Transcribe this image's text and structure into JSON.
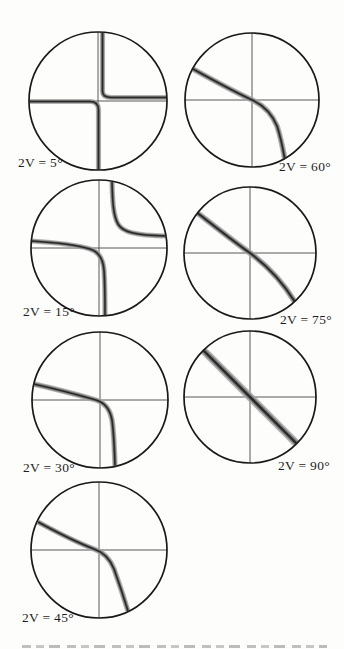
{
  "colors": {
    "background": "#fdfdfc",
    "circle_stroke": "#191919",
    "crosshair": "#454545",
    "band_outer": "#a6a6a6",
    "band_mid": "#7e7e7e",
    "band_core": "#2a2a2a",
    "label_text": "#1d1d1d"
  },
  "figure": {
    "kind": "circular interference figures with isogyre bands and crosshairs",
    "panels": [
      {
        "id": "2v-5",
        "label": "2V = 5°",
        "two_v_deg": 5,
        "radius": 69,
        "pos": {
          "left": 23,
          "top": 26
        },
        "label_pos": {
          "left": 18,
          "top": 155
        },
        "band_width": 5.2,
        "isogyre_form": "near-cross, two L-shaped branches (top-right and left-bottom) with tiny central break",
        "isogyres": [
          "M 4.5 -68.5 L 4.5 -10 Q 4.5 -3.5 13 -3.5 L 68.6 -3.5",
          "M -68.8 0.5 L -8 0.5 Q 0.5 0.5 0.5 9 L 0.5 68.8"
        ]
      },
      {
        "id": "2v-15",
        "label": "2V = 15°",
        "two_v_deg": 15,
        "radius": 68,
        "pos": {
          "left": 24,
          "top": 173
        },
        "label_pos": {
          "left": 23,
          "top": 304
        },
        "band_width": 5.2,
        "isogyre_form": "two separated hyperbola branches: upper-right (top to right edge) and lower-left (left edge to bottom)",
        "isogyres": [
          "M 13 -66.5 C 13.5 -48 14 -33 19 -24 C 23.5 -16 36 -12.5 67 -12",
          "M -67.5 -7 C -44 -5.5 -22 -3 -9 1 C -1 3.5 4 10 5 22 C 6 36 6 50 6 67"
        ]
      },
      {
        "id": "2v-30",
        "label": "2V = 30°",
        "two_v_deg": 30,
        "radius": 68,
        "pos": {
          "left": 25,
          "top": 325
        },
        "label_pos": {
          "left": 23,
          "top": 460
        },
        "band_width": 5.4,
        "isogyre_form": "single branch, sharp elbow at center: enters left edge above axis, exits bottom right of axis",
        "isogyres": [
          "M -66.5 -16 C -44 -11 -18 -4 -4 0 C 5 2.7 10 9 12 20 C 14 34 14.5 50 15 66"
        ]
      },
      {
        "id": "2v-45",
        "label": "2V = 45°",
        "two_v_deg": 45,
        "radius": 68,
        "pos": {
          "left": 24,
          "top": 475
        },
        "label_pos": {
          "left": 22,
          "top": 610
        },
        "band_width": 5.4,
        "isogyre_form": "single branch, strong curvature through center from upper-left to lower-bottom-right",
        "isogyres": [
          "M -61 -28 C -39 -16 -18 -6 -5 -1 C 4 2 11 9 15 19 C 20 33 25 48 29 61"
        ]
      },
      {
        "id": "2v-60",
        "label": "2V = 60°",
        "two_v_deg": 60,
        "radius": 67,
        "pos": {
          "left": 177,
          "top": 25
        },
        "label_pos": {
          "left": 279,
          "top": 159
        },
        "band_width": 5.6,
        "isogyre_form": "single branch, moderate curvature through center, convex toward upper right",
        "isogyres": [
          "M -59 -31 C -41 -21 -19 -9 -2 -1 C 10 4 20 14 25 26 C 29 38 31 49 33 60"
        ]
      },
      {
        "id": "2v-75",
        "label": "2V = 75°",
        "two_v_deg": 75,
        "radius": 66,
        "pos": {
          "left": 175,
          "top": 178
        },
        "label_pos": {
          "left": 280,
          "top": 312
        },
        "band_width": 6,
        "isogyre_form": "single branch, slight curvature, nearly diagonal through center",
        "isogyres": [
          "M -55 -42 C -37 -28 -17 -12 0 0 C 15 11 32 28 45 49"
        ]
      },
      {
        "id": "2v-90",
        "label": "2V = 90°",
        "two_v_deg": 90,
        "radius": 66,
        "pos": {
          "left": 175,
          "top": 322
        },
        "label_pos": {
          "left": 278,
          "top": 458
        },
        "band_width": 8,
        "isogyre_form": "single straight diagonal band at 45 degrees through center",
        "isogyres": [
          "M -47 -47 L 47 47"
        ]
      }
    ]
  },
  "caption_fragment": {
    "description": "top sliver of a cropped, illegible caption line at image bottom"
  }
}
